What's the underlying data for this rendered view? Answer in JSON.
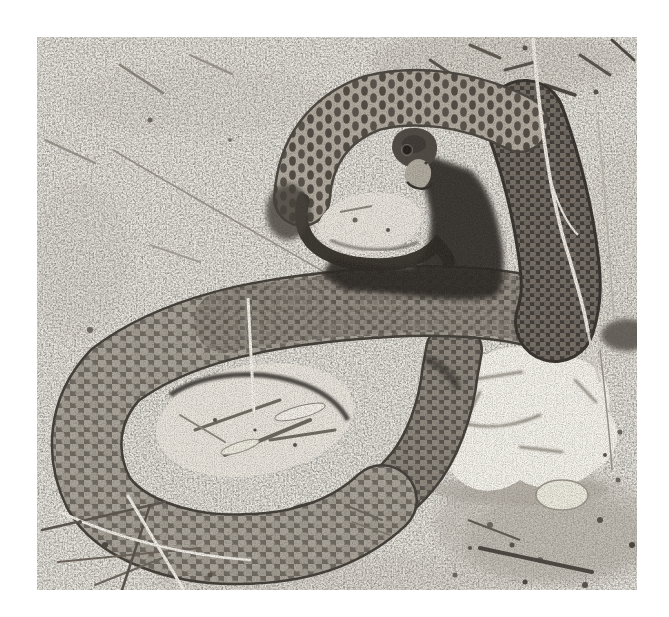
{
  "photo": {
    "alt": "Black-and-white photograph of a large snake lying in loose coils on bare sandy ground; its head is raised at upper centre above a dark shadowed loop, a thick body band descends on the right past a dried grass stem, a large coil encircles a sandy opening in the lower half, and a pale chalky rock sits at lower right among dark gravel, twigs and grass blades",
    "subject": "coiled snake on sandy ground",
    "style": "black-and-white halftone print with white paper border",
    "elements": {
      "snake_head": "dark head with pale snout and visible eye",
      "neck_band": "pale neck arc with dark scale bars",
      "throat_loop": "thin dark loop around a small sand patch under the head",
      "right_body_band": "thick dark scaled band descending on the right",
      "main_coil": "large scaled coil around a lens-shaped sandy opening",
      "tail_band": "tapering scaled band rising from the coil toward the rock",
      "rock": "pale irregular chalky rock at lower right",
      "grass_stem": "pale dried grass stem crossing the right body band",
      "ground": "pale sand with scattered twigs, blades and dark debris"
    },
    "palette": {
      "paper_white": "#ffffff",
      "sand": "#edeae3",
      "sand_shadow": "#cfc9bf",
      "scale_light": "#aaa49b",
      "scale_mid": "#8f887f",
      "scale_dark": "#776f66",
      "gap_dark": "#3f3a35",
      "deep_shadow": "#2c2823",
      "rock_white": "#f3f1ea",
      "debris_dark": "#4a453e"
    }
  }
}
